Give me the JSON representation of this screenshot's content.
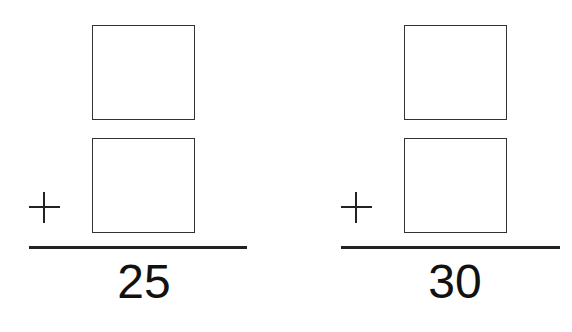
{
  "problems": [
    {
      "operator": "+",
      "addend_top": "",
      "addend_bottom": "",
      "sum": "25"
    },
    {
      "operator": "+",
      "addend_top": "",
      "addend_bottom": "",
      "sum": "30"
    }
  ],
  "colors": {
    "stroke": "#222222",
    "background": "#ffffff"
  }
}
